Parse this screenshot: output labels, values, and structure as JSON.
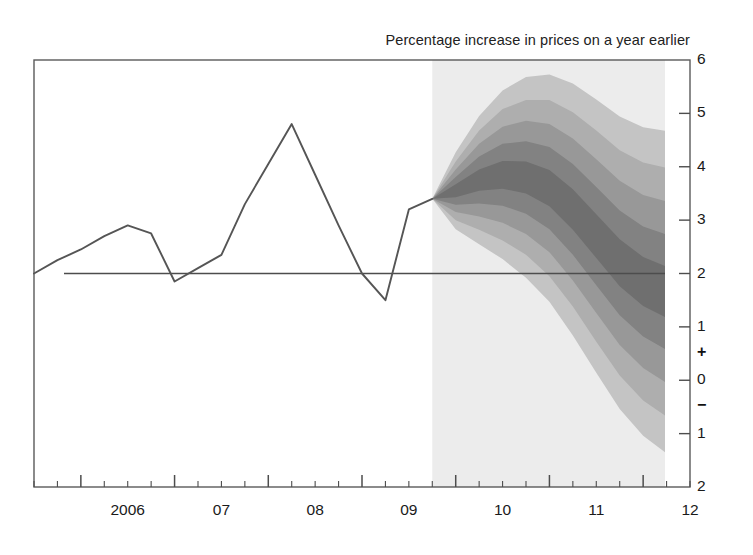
{
  "chart_data": {
    "type": "area",
    "title": "Percentage increase in prices on a year earlier",
    "xlabel": "",
    "ylabel": "",
    "ylim": [
      -2,
      6
    ],
    "xlim": [
      2005.5,
      2012.5
    ],
    "grid": false,
    "legend": "none",
    "y_ticks": [
      "6",
      "5",
      "4",
      "3",
      "2",
      "1",
      "0",
      "1",
      "2"
    ],
    "y_tick_values": [
      6,
      5,
      4,
      3,
      2,
      1,
      0,
      -1,
      -2
    ],
    "sign_markers": [
      {
        "symbol": "+",
        "value": 0.5
      },
      {
        "symbol": "−",
        "value": -0.5
      }
    ],
    "x_ticks": [
      "2006",
      "07",
      "08",
      "09",
      "10",
      "11",
      "12"
    ],
    "x_tick_values": [
      2006,
      2007,
      2008,
      2009,
      2010,
      2011,
      2012
    ],
    "minor_ticks_per_year": 4,
    "reference_line": {
      "value": 2.0,
      "label": "inflation target"
    },
    "forecast_start": 2009.75,
    "forecast_shading_color": "#ececec",
    "series": [
      {
        "name": "Historical CPI inflation",
        "type": "line",
        "color": "#555555",
        "x": [
          2005.5,
          2005.75,
          2006.0,
          2006.25,
          2006.5,
          2006.75,
          2007.0,
          2007.25,
          2007.5,
          2007.75,
          2008.0,
          2008.25,
          2008.5,
          2008.75,
          2009.0,
          2009.25,
          2009.5,
          2009.75
        ],
        "values": [
          2.0,
          2.25,
          2.45,
          2.7,
          2.9,
          2.75,
          1.85,
          2.1,
          2.35,
          3.3,
          4.05,
          4.8,
          3.85,
          2.9,
          2.0,
          1.5,
          3.2,
          3.4
        ]
      },
      {
        "name": "Fan chart projection (probability bands)",
        "type": "fan",
        "x": [
          2009.75,
          2010.0,
          2010.25,
          2010.5,
          2010.75,
          2011.0,
          2011.25,
          2011.5,
          2011.75,
          2012.0,
          2012.25,
          2012.4
        ],
        "central": [
          3.4,
          3.55,
          3.75,
          3.85,
          3.8,
          3.6,
          3.2,
          2.7,
          2.2,
          1.85,
          1.65,
          1.6
        ],
        "bands": [
          {
            "percentile": 10,
            "upper_offset": [
              0.0,
              0.12,
              0.2,
              0.26,
              0.3,
              0.34,
              0.38,
              0.41,
              0.44,
              0.46,
              0.48,
              0.49
            ],
            "lower_offset": [
              0.0,
              0.12,
              0.2,
              0.26,
              0.3,
              0.34,
              0.38,
              0.41,
              0.44,
              0.46,
              0.48,
              0.49
            ],
            "color": "#6f6f6f"
          },
          {
            "percentile": 30,
            "upper_offset": [
              0.0,
              0.26,
              0.44,
              0.58,
              0.68,
              0.77,
              0.85,
              0.92,
              0.98,
              1.03,
              1.08,
              1.1
            ],
            "lower_offset": [
              0.0,
              0.26,
              0.44,
              0.58,
              0.68,
              0.77,
              0.85,
              0.92,
              0.98,
              1.03,
              1.08,
              1.1
            ],
            "color": "#828282"
          },
          {
            "percentile": 50,
            "upper_offset": [
              0.0,
              0.4,
              0.68,
              0.9,
              1.06,
              1.2,
              1.33,
              1.44,
              1.54,
              1.62,
              1.7,
              1.73
            ],
            "lower_offset": [
              0.0,
              0.4,
              0.68,
              0.9,
              1.06,
              1.2,
              1.33,
              1.44,
              1.54,
              1.62,
              1.7,
              1.73
            ],
            "color": "#989898"
          },
          {
            "percentile": 70,
            "upper_offset": [
              0.0,
              0.55,
              0.93,
              1.23,
              1.45,
              1.65,
              1.82,
              1.98,
              2.11,
              2.23,
              2.33,
              2.37
            ],
            "lower_offset": [
              0.0,
              0.55,
              0.93,
              1.23,
              1.45,
              1.65,
              1.82,
              1.98,
              2.11,
              2.23,
              2.33,
              2.37
            ],
            "color": "#aeaeae"
          },
          {
            "percentile": 90,
            "upper_offset": [
              0.0,
              0.72,
              1.2,
              1.58,
              1.88,
              2.13,
              2.36,
              2.56,
              2.74,
              2.89,
              3.02,
              3.07
            ],
            "lower_offset": [
              0.0,
              0.72,
              1.2,
              1.58,
              1.88,
              2.13,
              2.36,
              2.56,
              2.74,
              2.89,
              3.02,
              3.07
            ],
            "color": "#c4c4c4"
          }
        ]
      }
    ]
  },
  "axis_geometry": {
    "plot_left": 34,
    "plot_right": 690,
    "plot_top": 60,
    "plot_bottom": 487,
    "fan_right_edge": 665
  }
}
